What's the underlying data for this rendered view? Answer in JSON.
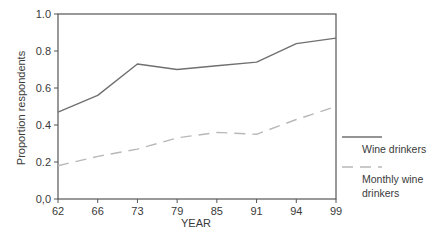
{
  "chart_data": {
    "type": "line",
    "title": "",
    "xlabel": "YEAR",
    "ylabel": "Proportion respondents",
    "categories": [
      "62",
      "66",
      "73",
      "79",
      "85",
      "91",
      "94",
      "99"
    ],
    "ylim": [
      0,
      1.0
    ],
    "yticks": [
      "0,0",
      "0.2",
      "0.4",
      "0.6",
      "0.8",
      "1.0"
    ],
    "ytick_values": [
      0,
      0.2,
      0.4,
      0.6,
      0.8,
      1.0
    ],
    "grid": false,
    "legend_position": "right",
    "series": [
      {
        "name": "Wine drinkers",
        "legend_lines": [
          "Wine drinkers"
        ],
        "style": "solid",
        "color": "#707070",
        "values": [
          0.47,
          0.56,
          0.73,
          0.7,
          0.72,
          0.74,
          0.84,
          0.87
        ]
      },
      {
        "name": "Monthly wine drinkers",
        "legend_lines": [
          "Monthly wine",
          "drinkers"
        ],
        "style": "dashed",
        "color": "#b8b8b8",
        "values": [
          0.18,
          0.23,
          0.27,
          0.33,
          0.36,
          0.35,
          0.43,
          0.5
        ]
      }
    ]
  }
}
